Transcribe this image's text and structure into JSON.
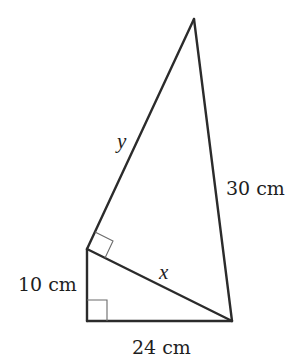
{
  "diagram": {
    "type": "geometry",
    "vertices": {
      "apex": [
        194,
        19
      ],
      "upper_left": [
        87,
        249
      ],
      "lower_left": [
        87,
        321
      ],
      "lower_right": [
        232,
        321
      ]
    },
    "labels": {
      "y": "y",
      "x": "x",
      "right_side": "30 cm",
      "left_side": "10 cm",
      "bottom_side": "24 cm"
    },
    "colors": {
      "line": "#2b2b2b",
      "right_angle_marker": "#6a6a6a",
      "text": "#1e1e1e",
      "background": "#ffffff"
    }
  }
}
